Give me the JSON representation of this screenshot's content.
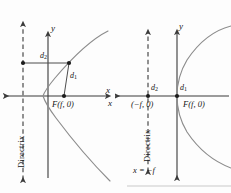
{
  "figure": {
    "stroke_color": "#4d4d4d",
    "axis_color": "#3a3a3a",
    "curve_color": "#8c8c8c",
    "text_color": "#151515"
  },
  "left_panel": {
    "name": "parabola-focus-right-of-directrix",
    "axis_x_label": "x",
    "axis_y_label": "y",
    "distance_focal": "d",
    "distance_focal_sub": "1",
    "distance_directrix": "d",
    "distance_directrix_sub": "2",
    "focus_label": "F(f, 0)",
    "directrix_label": "Directrix",
    "geometry": {
      "origin": [
        64,
        96
      ],
      "directrix_x": 23,
      "focus_point": [
        65,
        96
      ],
      "curve_point": [
        69,
        64
      ],
      "foot_point": [
        23,
        64
      ]
    }
  },
  "right_panel": {
    "name": "parabola-with-directrix-equation",
    "axis_x_label": "x",
    "axis_y_label": "y",
    "distance_focal": "d",
    "distance_focal_sub": "1",
    "distance_directrix": "d",
    "distance_directrix_sub": "2",
    "focus_label": "F(f, 0)",
    "directrix_point_label": "(−f, 0)",
    "directrix_label": "Directrix",
    "directrix_equation": "x = −f",
    "geometry": {
      "origin": [
        62,
        96
      ],
      "directrix_x": 33,
      "focus_point": [
        62,
        96
      ]
    }
  }
}
